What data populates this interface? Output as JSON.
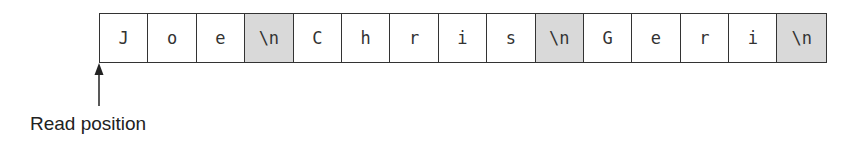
{
  "buffer": {
    "cells": [
      {
        "char": "J",
        "newline": false
      },
      {
        "char": "o",
        "newline": false
      },
      {
        "char": "e",
        "newline": false
      },
      {
        "char": "\\n",
        "newline": true
      },
      {
        "char": "C",
        "newline": false
      },
      {
        "char": "h",
        "newline": false
      },
      {
        "char": "r",
        "newline": false
      },
      {
        "char": "i",
        "newline": false
      },
      {
        "char": "s",
        "newline": false
      },
      {
        "char": "\\n",
        "newline": true
      },
      {
        "char": "G",
        "newline": false
      },
      {
        "char": "e",
        "newline": false
      },
      {
        "char": "r",
        "newline": false
      },
      {
        "char": "i",
        "newline": false
      },
      {
        "char": "\\n",
        "newline": true
      }
    ]
  },
  "pointer": {
    "label": "Read position",
    "index": 0
  },
  "colors": {
    "newline_fill": "#d9d9d9",
    "border": "#333333"
  }
}
